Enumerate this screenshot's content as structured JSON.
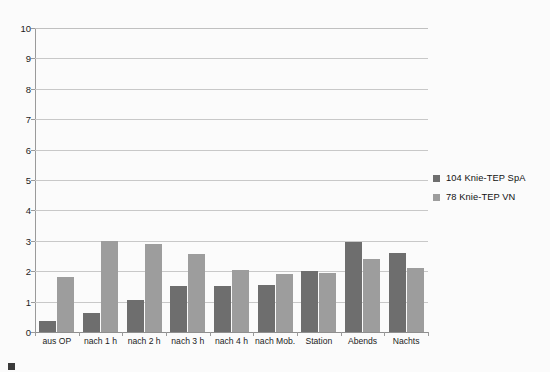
{
  "chart_data": {
    "type": "bar",
    "title": "",
    "subtitle": "",
    "xlabel": "",
    "ylabel": "",
    "ylim": [
      0,
      10
    ],
    "yticks": [
      0,
      1,
      2,
      3,
      4,
      5,
      6,
      7,
      8,
      9,
      10
    ],
    "ytick_labels": [
      "0",
      "1",
      "2",
      "3",
      "4",
      "5",
      "6",
      "7",
      "8",
      "9",
      "10"
    ],
    "grid": true,
    "legend_position": "right",
    "categories": [
      "aus OP",
      "nach 1 h",
      "nach 2 h",
      "nach 3 h",
      "nach 4 h",
      "nach Mob.",
      "Station",
      "Abends",
      "Nachts"
    ],
    "series": [
      {
        "name": "104 Knie-TEP SpA",
        "color": "#6e6e6e",
        "values": [
          0.35,
          0.62,
          1.05,
          1.5,
          1.5,
          1.55,
          2.0,
          2.95,
          2.6
        ]
      },
      {
        "name": "78 Knie-TEP VN",
        "color": "#9d9d9d",
        "values": [
          1.8,
          3.0,
          2.9,
          2.55,
          2.05,
          1.9,
          1.95,
          2.4,
          2.1
        ]
      }
    ]
  },
  "legend": {
    "items": [
      {
        "label": "104 Knie-TEP SpA",
        "color": "#6e6e6e"
      },
      {
        "label": "78 Knie-TEP VN",
        "color": "#9d9d9d"
      }
    ]
  },
  "caption": {
    "text": ""
  },
  "colors": {
    "background": "#fbfbfb",
    "grid": "#c8c8c8",
    "axis": "#9a9a9a",
    "series_dark": "#6e6e6e",
    "series_light": "#9d9d9d",
    "text": "#1b1b1b"
  }
}
